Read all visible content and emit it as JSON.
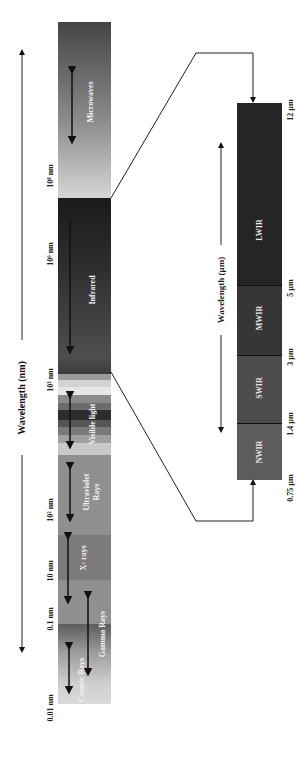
{
  "axis": {
    "main_title": "Wavelength (nm)",
    "ir_title": "Wavelength (µm)"
  },
  "spectrum": {
    "bands": [
      {
        "name": "Microwaves",
        "label": "Microwaves",
        "color_top": "#4a4a4a",
        "color_bottom": "#cfcfcf"
      },
      {
        "name": "Infrared",
        "label": "Infrared",
        "color_top": "#1f1f1f",
        "color_bottom": "#5a5a5a"
      },
      {
        "name": "Visible light",
        "label": "Visible light"
      },
      {
        "name": "Ultraviolet Rays",
        "label_line1": "Ultraviolet",
        "label_line2": "Rays",
        "color": "#8e8e8e"
      },
      {
        "name": "X-rays",
        "label": "X- rays",
        "color": "#7c7c7c"
      },
      {
        "name": "Gamma Rays",
        "label": "Gamma Rays"
      },
      {
        "name": "Cosmic Rays",
        "label": "Cosmic Rays"
      }
    ],
    "ticks": [
      {
        "label": "10⁸ nm"
      },
      {
        "label": "10⁶ nm"
      },
      {
        "label": "10³ nm"
      },
      {
        "label": "10² nm"
      },
      {
        "label": "10 nm"
      },
      {
        "label": "0.1 nm"
      },
      {
        "label": "0.01 nm"
      }
    ]
  },
  "infrared_detail": {
    "segments": [
      {
        "label": "LWIR",
        "color": "#262626"
      },
      {
        "label": "MWIR",
        "color": "#383838"
      },
      {
        "label": "SWIR",
        "color": "#505050"
      },
      {
        "label": "NWIR",
        "color": "#5e5e5e"
      }
    ],
    "ticks": [
      {
        "label": "12 µm"
      },
      {
        "label": "5 µm"
      },
      {
        "label": "3 µm"
      },
      {
        "label": "1.4 µm"
      },
      {
        "label": "0.75 µm"
      }
    ]
  }
}
